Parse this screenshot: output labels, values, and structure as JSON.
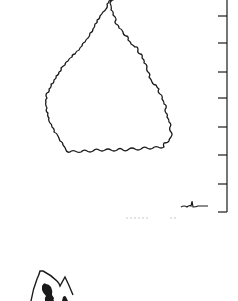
{
  "figure": {
    "colors": {
      "ink": "#1a1a1a",
      "background": "#ffffff",
      "faint": "#c8c8c8"
    },
    "scale_bar": {
      "x": 227,
      "y_top": 0,
      "y_bottom": 212,
      "tick_y": [
        16,
        43,
        72,
        98,
        127,
        155,
        184,
        212
      ]
    }
  }
}
